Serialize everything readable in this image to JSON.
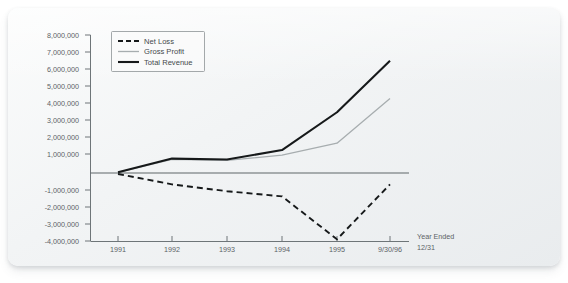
{
  "chart_data": {
    "type": "line",
    "title": "",
    "xlabel": "Year Ended 12/31",
    "ylabel": "",
    "categories": [
      "1991",
      "1992",
      "1993",
      "1994",
      "1995",
      "9/30/96"
    ],
    "ylim": [
      -4000000,
      8000000
    ],
    "yticks": [
      8000000,
      7000000,
      6000000,
      5000000,
      4000000,
      3000000,
      2000000,
      1000000,
      -1000000,
      -2000000,
      -3000000,
      -4000000
    ],
    "ytick_labels": [
      "8,000,000",
      "7,000,000",
      "6,000,000",
      "5,000,000",
      "4,000,000",
      "3,000,000",
      "2,000,000",
      "1,000,000",
      "-1,000,000",
      "-2,000,000",
      "-3,000,000",
      "-4,000,000"
    ],
    "grid": false,
    "legend_position": "top-left",
    "zero_line": true,
    "series": [
      {
        "name": "Net Loss",
        "style": "dashed",
        "color": "#16191a",
        "values": [
          -100000,
          -700000,
          -1100000,
          -1400000,
          -3900000,
          -700000
        ]
      },
      {
        "name": "Gross Profit",
        "style": "thin-solid",
        "color": "#a7adaf",
        "values": [
          0,
          750000,
          700000,
          1000000,
          1700000,
          4300000
        ]
      },
      {
        "name": "Total Revenue",
        "style": "thick-solid",
        "color": "#16191a",
        "values": [
          0,
          800000,
          750000,
          1300000,
          3500000,
          6500000
        ]
      }
    ],
    "annotations": [
      {
        "name": "year-ended-note",
        "lines": [
          "Year Ended",
          "12/31"
        ]
      }
    ]
  },
  "colors": {
    "card_background": "#f2f4f5",
    "axis": "#6e7578",
    "text": "#5c6366",
    "net_loss": "#16191a",
    "gross_profit": "#a7adaf",
    "total_revenue": "#16191a"
  }
}
